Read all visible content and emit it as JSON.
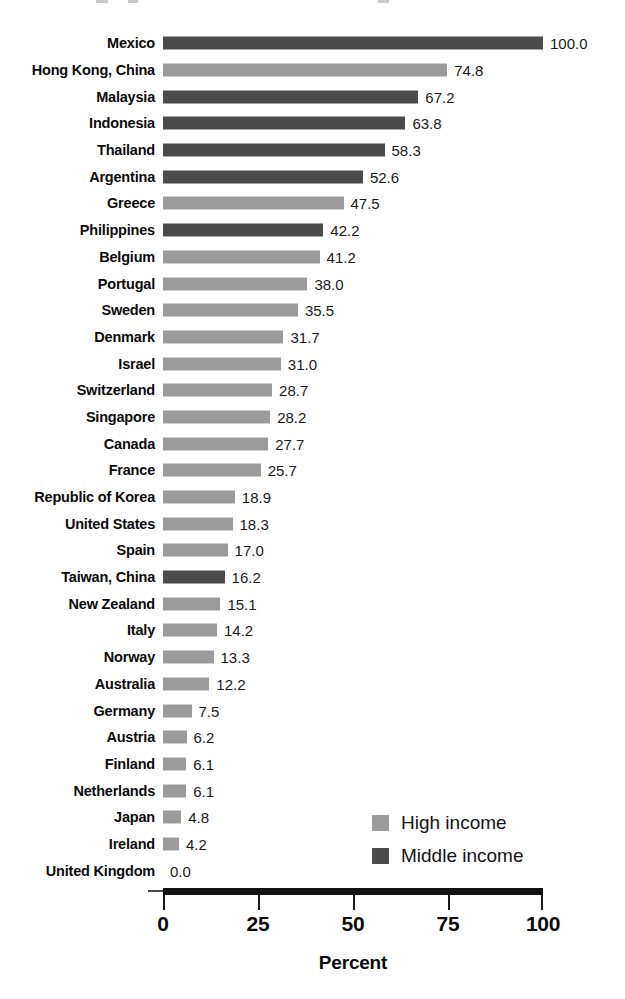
{
  "chart_data": {
    "type": "bar",
    "orientation": "horizontal",
    "title": "",
    "xlabel": "Percent",
    "ylabel": "",
    "xlim": [
      0,
      100
    ],
    "xticks": [
      "0",
      "25",
      "50",
      "75",
      "100"
    ],
    "grid": false,
    "legend_position": "bottom-right",
    "categories": [
      "Mexico",
      "Hong Kong, China",
      "Malaysia",
      "Indonesia",
      "Thailand",
      "Argentina",
      "Greece",
      "Philippines",
      "Belgium",
      "Portugal",
      "Sweden",
      "Denmark",
      "Israel",
      "Switzerland",
      "Singapore",
      "Canada",
      "France",
      "Republic of Korea",
      "United States",
      "Spain",
      "Taiwan, China",
      "New Zealand",
      "Italy",
      "Norway",
      "Australia",
      "Germany",
      "Austria",
      "Finland",
      "Netherlands",
      "Japan",
      "Ireland",
      "United Kingdom"
    ],
    "values": [
      100.0,
      74.8,
      67.2,
      63.8,
      58.3,
      52.6,
      47.5,
      42.2,
      41.2,
      38.0,
      35.5,
      31.7,
      31.0,
      28.7,
      28.2,
      27.7,
      25.7,
      18.9,
      18.3,
      17.0,
      16.2,
      15.1,
      14.2,
      13.3,
      12.2,
      7.5,
      6.2,
      6.1,
      6.1,
      4.8,
      4.2,
      0.0
    ],
    "value_labels": [
      "100.0",
      "74.8",
      "67.2",
      "63.8",
      "58.3",
      "52.6",
      "47.5",
      "42.2",
      "41.2",
      "38.0",
      "35.5",
      "31.7",
      "31.0",
      "28.7",
      "28.2",
      "27.7",
      "25.7",
      "18.9",
      "18.3",
      "17.0",
      "16.2",
      "15.1",
      "14.2",
      "13.3",
      "12.2",
      "7.5",
      "6.2",
      "6.1",
      "6.1",
      "4.8",
      "4.2",
      "0.0"
    ],
    "groups": [
      "middle",
      "high",
      "middle",
      "middle",
      "middle",
      "middle",
      "high",
      "middle",
      "high",
      "high",
      "high",
      "high",
      "high",
      "high",
      "high",
      "high",
      "high",
      "high",
      "high",
      "high",
      "middle",
      "high",
      "high",
      "high",
      "high",
      "high",
      "high",
      "high",
      "high",
      "high",
      "high",
      "high"
    ],
    "legend": [
      {
        "key": "high",
        "label": "High income",
        "color": "#9b9b9b"
      },
      {
        "key": "middle",
        "label": "Middle income",
        "color": "#4b4b4b"
      }
    ]
  },
  "colors": {
    "high_income": "#9b9b9b",
    "middle_income": "#4b4b4b",
    "axis": "#111111",
    "text": "#0b0b0b",
    "background": "#ffffff"
  }
}
